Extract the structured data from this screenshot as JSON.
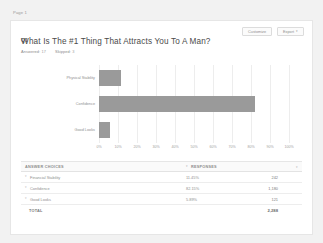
{
  "page_label": "Page 1",
  "header": {
    "question_number": "Q1",
    "title": "What Is The #1 Thing That Attracts You To A Man?",
    "answered_label": "Answered:",
    "answered_value": "17",
    "skipped_label": "Skipped:",
    "skipped_value": "3",
    "customize_button": "Customize",
    "export_button": "Export",
    "export_caret": "▾"
  },
  "chart_data": {
    "type": "bar",
    "orientation": "horizontal",
    "title": "",
    "xlabel": "",
    "ylabel": "",
    "categories": [
      "Physical Stability",
      "Confidence",
      "Good Looks"
    ],
    "values": [
      11.45,
      82.15,
      5.89
    ],
    "xlim": [
      0,
      100
    ],
    "xticks": [
      "0%",
      "10%",
      "20%",
      "30%",
      "40%",
      "50%",
      "60%",
      "70%",
      "80%",
      "90%",
      "100%"
    ],
    "grid": true,
    "legend": "none",
    "bar_color": "#9a9a9a"
  },
  "table": {
    "columns": {
      "choices": "ANSWER CHOICES",
      "responses": "RESPONSES"
    },
    "rows": [
      {
        "choice": "Financial Stability",
        "percent": "11.45%",
        "count": "242"
      },
      {
        "choice": "Confidence",
        "percent": "82.15%",
        "count": "1,180"
      },
      {
        "choice": "Good Looks",
        "percent": "5.89%",
        "count": "121"
      }
    ],
    "total_label": "TOTAL",
    "total_value": "2,288"
  },
  "icons": {
    "sort_caret": "▾",
    "row_caret": "▾"
  }
}
